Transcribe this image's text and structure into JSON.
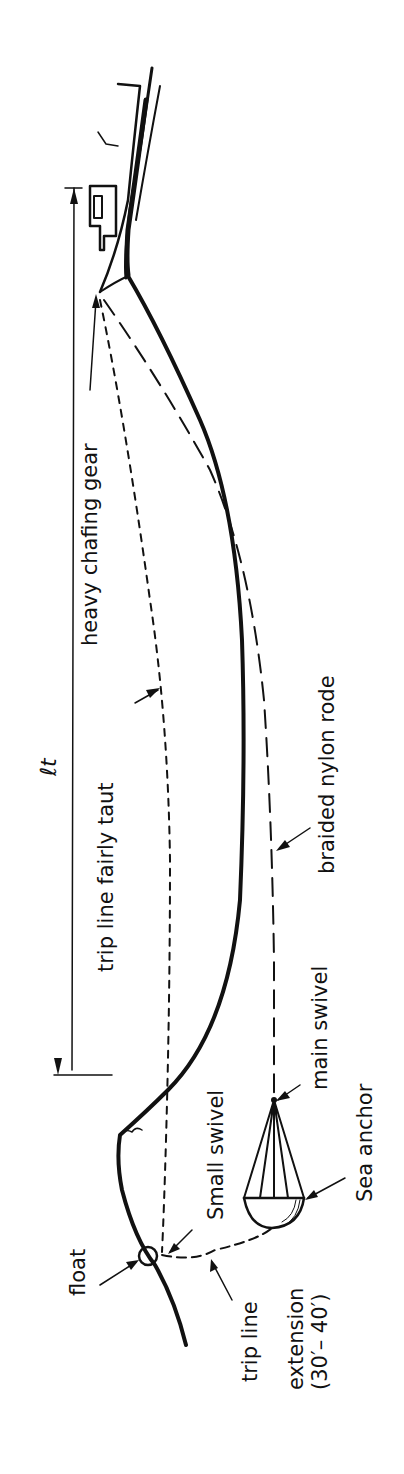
{
  "diagram": {
    "orientation": "rotated 90 degrees counter-clockwise",
    "colors": {
      "ink": "#111111",
      "background": "#ffffff"
    },
    "labels": {
      "dimension": "ℓt",
      "heavy_chafing_gear": "heavy chafing gear",
      "trip_line_fairly_taut": "trip line fairly taut",
      "braided_nylon_rode": "braided nylon rode",
      "small_swivel": "Small swivel",
      "main_swivel": "main swivel",
      "sea_anchor": "Sea anchor",
      "float": "float",
      "trip_line": "trip line",
      "extension": "extension",
      "extension_length": "(30′– 40′)"
    },
    "elements": [
      {
        "name": "boat",
        "description": "Vessel hull with cabin at top of drawing"
      },
      {
        "name": "wave-crest",
        "description": "Solid heavy line of sea surface"
      },
      {
        "name": "rode",
        "description": "Long-dash braided nylon rode from bow to sea anchor"
      },
      {
        "name": "trip-line",
        "description": "Short-dash trip line from bow to float"
      },
      {
        "name": "trip-line-extension",
        "description": "Dashed line from float to sea anchor"
      },
      {
        "name": "sea-anchor",
        "description": "Cone-shaped parachute drogue"
      },
      {
        "name": "float",
        "description": "Small circular buoy"
      },
      {
        "name": "dimension-line",
        "description": "Length ℓt between bow and wave trough"
      }
    ]
  }
}
